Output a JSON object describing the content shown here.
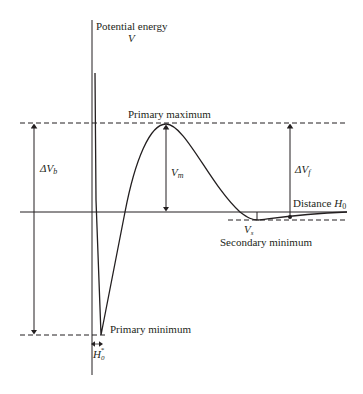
{
  "diagram": {
    "title": "Potential energy",
    "y_symbol": "V",
    "labels": {
      "primary_maximum": "Primary maximum",
      "primary_minimum": "Primary minimum",
      "secondary_minimum": "Secondary minimum",
      "distance_label": "Distance",
      "distance_symbol": "H",
      "distance_subscript": "0",
      "delta_vb": "ΔV",
      "delta_vb_sub": "b",
      "delta_vf": "ΔV",
      "delta_vf_sub": "f",
      "vm": "V",
      "vm_sub": "m",
      "vs": "V",
      "vs_sub": "s",
      "h0_star": "H",
      "h0_star_sub": "0",
      "h0_star_sup": "*"
    },
    "colors": {
      "line": "#231f20",
      "background": "#ffffff"
    }
  }
}
